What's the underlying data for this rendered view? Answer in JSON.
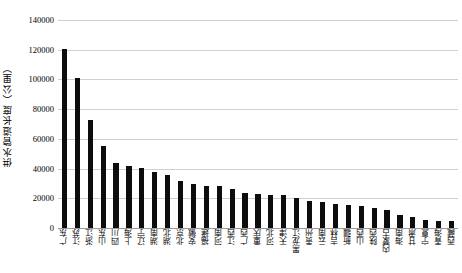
{
  "chart_data": {
    "type": "bar",
    "title": "",
    "subtitle": "",
    "xlabel": "",
    "ylabel": "供水管道长度（公里）",
    "ylim": [
      0,
      140000
    ],
    "ytick_values": [
      0,
      20000,
      40000,
      60000,
      80000,
      100000,
      120000,
      140000
    ],
    "ytick_labels": [
      "0",
      "20000",
      "40000",
      "60000",
      "80000",
      "100000",
      "120000",
      "140000"
    ],
    "grid": true,
    "legend": null,
    "bar_color": "#0d0d0d",
    "gridline_color": "#d0d0d0",
    "categories": [
      "广东",
      "江苏",
      "浙江",
      "山东",
      "四川",
      "上海",
      "辽宁",
      "湖南",
      "湖北",
      "北京",
      "安徽",
      "福建",
      "河南",
      "江西",
      "广西",
      "重庆",
      "河北",
      "天津",
      "黑龙江",
      "贵州",
      "云南",
      "吉林",
      "新疆",
      "山西",
      "陕西",
      "内蒙古",
      "海南",
      "甘肃",
      "宁夏",
      "青海",
      "西藏"
    ],
    "values": [
      120500,
      101000,
      72500,
      55500,
      43500,
      42000,
      40500,
      37500,
      36000,
      31500,
      29500,
      28500,
      28000,
      26500,
      23500,
      23000,
      22500,
      22000,
      20500,
      18500,
      17500,
      16500,
      15500,
      14500,
      13500,
      12000,
      8500,
      7500,
      5500,
      5000,
      4500
    ]
  }
}
